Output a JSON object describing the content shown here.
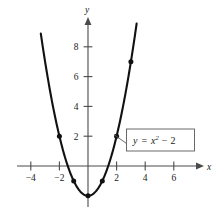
{
  "figure": {
    "title": "",
    "axis_x_name": "x",
    "axis_y_name": "y",
    "equation_label": "y = x² − 2",
    "equation_parts": {
      "lhs": "y",
      "equals": "=",
      "base": "x",
      "exponent": "2",
      "minus": "−",
      "constant": "2"
    },
    "colors": {
      "curve": "#111111",
      "axis": "#4a4a4a",
      "text": "#1a1a1a",
      "callout_border": "#5a5a5a",
      "background": "#ffffff"
    }
  },
  "chart_data": {
    "type": "line",
    "title": "",
    "xlabel": "x",
    "ylabel": "y",
    "xlim": [
      -5.0,
      8.2
    ],
    "ylim": [
      -3.4,
      9.9
    ],
    "grid": false,
    "legend": null,
    "annotations": [
      {
        "text": "y = x² − 2",
        "x": 4.3,
        "y": 1.2,
        "style": "boxed-callout",
        "points_to": [
          1.78,
          1.15
        ]
      }
    ],
    "xticks": [
      -4,
      -2,
      2,
      4,
      6
    ],
    "xtick_labels": [
      "−4",
      "−2",
      "2",
      "4",
      "6"
    ],
    "yticks": [
      2,
      4,
      6,
      8
    ],
    "ytick_labels": [
      "2",
      "4",
      "6",
      "8"
    ],
    "series": [
      {
        "name": "y = x² − 2",
        "equation": "y = x^2 - 2",
        "marked_points": [
          {
            "x": -2,
            "y": 2
          },
          {
            "x": -1,
            "y": -1
          },
          {
            "x": 0,
            "y": -2
          },
          {
            "x": 1,
            "y": -1
          },
          {
            "x": 2,
            "y": 2
          },
          {
            "x": 3,
            "y": 7
          }
        ],
        "x": [
          -3.3,
          -3.0,
          -2.5,
          -2.0,
          -1.5,
          -1.0,
          -0.5,
          0.0,
          0.5,
          1.0,
          1.5,
          2.0,
          2.5,
          3.0,
          3.4
        ],
        "values": [
          8.89,
          7.0,
          4.25,
          2.0,
          0.25,
          -1.0,
          -1.75,
          -2.0,
          -1.75,
          -1.0,
          0.25,
          2.0,
          4.25,
          7.0,
          9.56
        ]
      }
    ]
  }
}
